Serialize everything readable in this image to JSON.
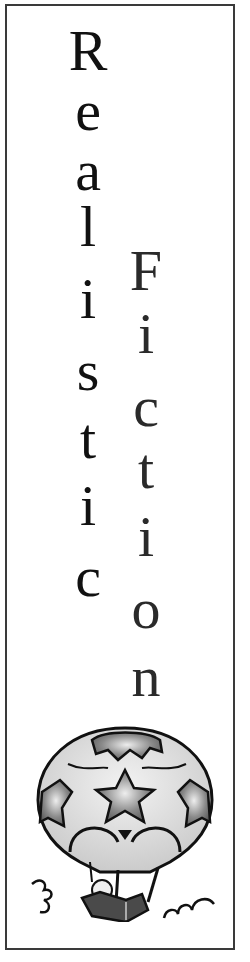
{
  "title": {
    "word1": "Realistic",
    "word2": "Fiction"
  },
  "column1": {
    "letters": [
      {
        "ch": "R",
        "top": 22,
        "size": 58
      },
      {
        "ch": "e",
        "top": 82,
        "size": 58
      },
      {
        "ch": "a",
        "top": 142,
        "size": 58
      },
      {
        "ch": "l",
        "top": 198,
        "size": 58
      },
      {
        "ch": "i",
        "top": 270,
        "size": 58
      },
      {
        "ch": "s",
        "top": 342,
        "size": 58
      },
      {
        "ch": "t",
        "top": 410,
        "size": 58
      },
      {
        "ch": "i",
        "top": 477,
        "size": 58
      },
      {
        "ch": "c",
        "top": 548,
        "size": 58
      }
    ],
    "center_x": 88
  },
  "column2": {
    "letters": [
      {
        "ch": "F",
        "top": 242,
        "size": 58
      },
      {
        "ch": "i",
        "top": 305,
        "size": 58
      },
      {
        "ch": "c",
        "top": 378,
        "size": 58
      },
      {
        "ch": "t",
        "top": 440,
        "size": 58
      },
      {
        "ch": "i",
        "top": 508,
        "size": 58
      },
      {
        "ch": "o",
        "top": 580,
        "size": 58
      },
      {
        "ch": "n",
        "top": 648,
        "size": 58
      }
    ],
    "center_x": 146
  },
  "illustration": {
    "subject": "hot-air-balloon-with-reader",
    "colors": {
      "balloon_fill": "#d4d4d4",
      "star_fill": "#7a7a7a",
      "outline": "#111111",
      "basket": "#4a4a4a"
    }
  },
  "frame": {
    "border_color": "#3a3a3a"
  }
}
